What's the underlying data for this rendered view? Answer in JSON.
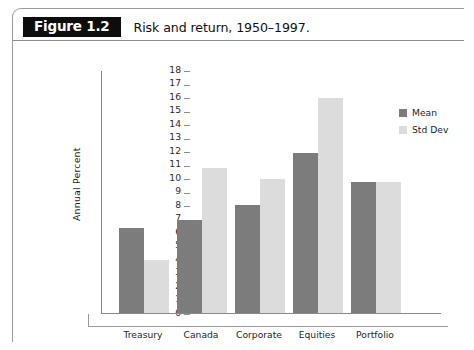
{
  "figure": {
    "badge": "Figure 1.2",
    "caption": "Risk and return, 1950–1997."
  },
  "colors": {
    "mean": "#7c7c7c",
    "std_dev": "#dcdcdc",
    "badge_bg": "#0d0d0d",
    "axis": "#8a8a8a"
  },
  "chart_data": {
    "type": "bar",
    "title": "Risk and return, 1950–1997.",
    "xlabel": "",
    "ylabel": "Annual Percent",
    "ylim": [
      0,
      18
    ],
    "ytick_step": 1,
    "yticks": [
      0,
      1,
      2,
      3,
      4,
      5,
      6,
      7,
      8,
      9,
      10,
      11,
      12,
      13,
      14,
      15,
      16,
      17,
      18
    ],
    "ytick_labels": [
      "0",
      "1",
      "2",
      "3",
      "4",
      "5",
      "6",
      "7",
      "8",
      "9",
      "10",
      "11",
      "12",
      "13",
      "14",
      "15",
      "16",
      "17",
      "18"
    ],
    "grid": false,
    "legend_position": "right",
    "categories": [
      "Treasury Bills",
      "Canada Bonds",
      "Corporate Bonds",
      "Equities",
      "Portfolio"
    ],
    "category_lines": [
      [
        "Treasury",
        "Bills"
      ],
      [
        "Canada",
        "Bonds"
      ],
      [
        "Corporate",
        "Bonds"
      ],
      [
        "Equities",
        ""
      ],
      [
        "Portfolio",
        ""
      ]
    ],
    "series": [
      {
        "name": "Mean",
        "color": "#7c7c7c",
        "values": [
          6.4,
          7.0,
          8.1,
          11.9,
          9.8
        ]
      },
      {
        "name": "Std Dev",
        "color": "#dcdcdc",
        "values": [
          4.0,
          10.8,
          10.0,
          16.0,
          9.8
        ]
      }
    ]
  }
}
